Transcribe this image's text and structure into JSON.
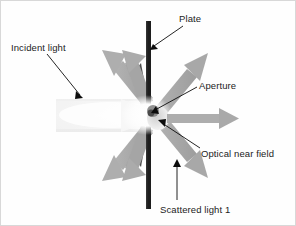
{
  "diagram": {
    "title_shown": false,
    "background_color": "#fefefe",
    "labels": [
      {
        "id": "plate",
        "text": "Plate",
        "x": 178,
        "y": 12
      },
      {
        "id": "incident-light",
        "text": "Incident light",
        "x": 10,
        "y": 41
      },
      {
        "id": "aperture",
        "text": "Aperture",
        "x": 198,
        "y": 79
      },
      {
        "id": "optical-near-field",
        "text": "Optical near field",
        "x": 200,
        "y": 147
      },
      {
        "id": "scattered-light-1",
        "text": "Scattered light 1",
        "x": 159,
        "y": 203
      }
    ],
    "colors": {
      "plate": "#1d1d1d",
      "beam_light": "#e8e8e8",
      "beam_core": "#fbfbfb",
      "arrow_gray": "#a8a8a8",
      "arrow_gray_dark": "#949494",
      "wedge_dark": "#3c3c3c",
      "leader_line": "#000000",
      "text": "#232323",
      "glow": "#ffffff",
      "aperture_dot": "#4a4a4a"
    },
    "plate": {
      "x": 145,
      "y_top": 20,
      "y_bottom": 208,
      "width": 5
    },
    "aperture_point": {
      "x": 148,
      "y": 114
    },
    "incident_beam": {
      "direction": "left-to-right",
      "x_start": 55,
      "x_end": 146,
      "y_top": 98,
      "y_bottom": 131
    },
    "transmitted_arrow": {
      "label_ref": "optical-near-field",
      "from_x": 160,
      "from_y": 118,
      "to_x": 237,
      "to_y": 118
    },
    "scattered_arrows": [
      {
        "id": "scatter-up-left",
        "angle_deg": 135,
        "side": "incident",
        "length": 72
      },
      {
        "id": "scatter-up-mid",
        "angle_deg": 108,
        "side": "incident",
        "length": 68
      },
      {
        "id": "scatter-up-right",
        "angle_deg": 48,
        "side": "transmitted",
        "length": 74
      },
      {
        "id": "scatter-down-left",
        "angle_deg": 225,
        "side": "incident",
        "length": 72
      },
      {
        "id": "scatter-down-mid",
        "angle_deg": 252,
        "side": "incident",
        "length": 68
      },
      {
        "id": "scatter-down-right",
        "angle_deg": 312,
        "side": "transmitted",
        "length": 74
      }
    ],
    "leader_lines": [
      {
        "id": "leader-plate",
        "from_x": 182,
        "from_y": 26,
        "to_x": 151,
        "to_y": 47
      },
      {
        "id": "leader-incident-light",
        "from_x": 47,
        "from_y": 54,
        "to_x": 80,
        "to_y": 96
      },
      {
        "id": "leader-aperture",
        "from_x": 196,
        "from_y": 86,
        "to_x": 152,
        "to_y": 110
      },
      {
        "id": "leader-optical-near-field",
        "from_x": 199,
        "from_y": 148,
        "to_x": 160,
        "to_y": 121
      },
      {
        "id": "leader-scattered-light-1",
        "from_x": 176,
        "from_y": 200,
        "to_x": 176,
        "to_y": 160
      }
    ]
  }
}
